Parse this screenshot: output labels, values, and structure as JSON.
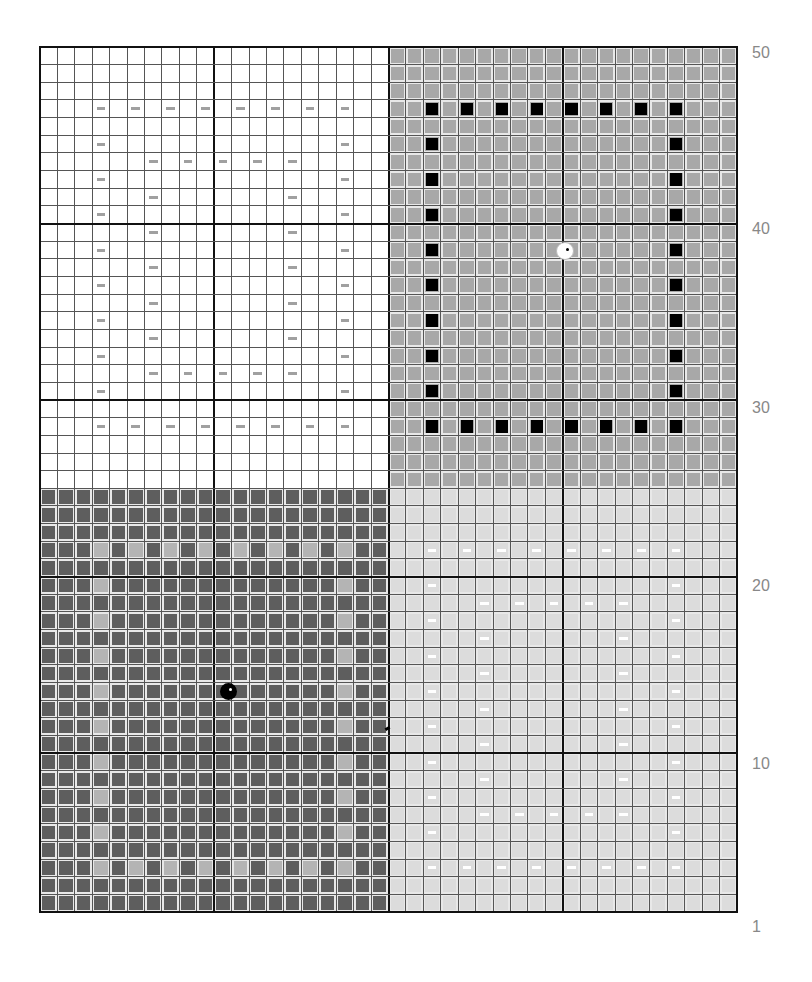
{
  "pattern": {
    "cols": 40,
    "rows": 49,
    "cell_w": 17.425,
    "cell_h": 17.653,
    "thick_every": 10,
    "split_col": 20,
    "split_row": 25,
    "colors": {
      "q_tl_bg": "#ffffff",
      "q_tr_bg": "#a8a8a8",
      "q_bl_bg": "#5e5e5e",
      "q_br_bg": "#dcdcdc",
      "cell_gap": "#e8e8e8",
      "tl_dash": "#a0a0a0",
      "tr_mark": "#000000",
      "bl_mark": "#b4b4b4",
      "br_dash": "#ffffff",
      "grid_line": "#555555",
      "grid_thick": "#111111"
    },
    "motif_offsets": {
      "tl": [
        0,
        3
      ],
      "tr": [
        20,
        2
      ],
      "bl": [
        25,
        3
      ],
      "br": [
        25,
        22
      ]
    },
    "motif": {
      "outer_top": 3,
      "outer_bottom": 21,
      "outer_cols_step": 2,
      "outer_col_span": 14,
      "inner_top": 6,
      "inner_bottom": 18,
      "inner_left": 3,
      "inner_right": 11
    },
    "beads": [
      {
        "name": "white-bead",
        "row": 11,
        "col": 29.6,
        "color": "#ffffff",
        "dot": "#000000",
        "size": 16
      },
      {
        "name": "black-bead",
        "row": 36,
        "col": 10.3,
        "color": "#000000",
        "dot": "#ffffff",
        "size": 17
      }
    ],
    "small_mark": {
      "row": 38,
      "col": 19.3
    }
  },
  "row_labels": [
    {
      "text": "50",
      "y": 54
    },
    {
      "text": "40",
      "y": 230
    },
    {
      "text": "30",
      "y": 409
    },
    {
      "text": "20",
      "y": 587
    },
    {
      "text": "10",
      "y": 765
    },
    {
      "text": "1",
      "y": 928
    }
  ]
}
